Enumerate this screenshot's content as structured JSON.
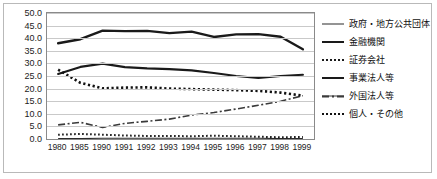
{
  "chart_data": {
    "type": "line",
    "title": "",
    "xlabel": "",
    "ylabel": "",
    "grid": true,
    "legend_position": "right",
    "ylim": [
      0.0,
      50.0
    ],
    "ytick_step": 5.0,
    "yticks": [
      "0.0",
      "5.0",
      "10.0",
      "15.0",
      "20.0",
      "25.0",
      "30.0",
      "35.0",
      "40.0",
      "45.0",
      "50.0"
    ],
    "categories": [
      "1980",
      "1985",
      "1990",
      "1991",
      "1992",
      "1993",
      "1994",
      "1995",
      "1996",
      "1997",
      "1998",
      "1999"
    ],
    "series": [
      {
        "name": "政府・地方公共団体",
        "style": "solid-thin",
        "values": [
          0.2,
          0.2,
          0.3,
          0.3,
          0.3,
          0.3,
          0.3,
          0.3,
          0.3,
          0.3,
          0.2,
          0.2
        ]
      },
      {
        "name": "金融機関",
        "style": "solid-thick",
        "values": [
          25.8,
          28.6,
          29.9,
          28.5,
          28.0,
          27.7,
          27.2,
          26.2,
          25.0,
          24.2,
          25.0,
          25.5
        ]
      },
      {
        "name": "証券会社",
        "style": "dotted",
        "values": [
          1.7,
          2.0,
          1.7,
          1.4,
          1.2,
          1.2,
          1.1,
          1.3,
          1.1,
          0.9,
          0.7,
          0.8
        ]
      },
      {
        "name": "事業法人等",
        "style": "solid-thick-upper",
        "values": [
          38.0,
          39.6,
          43.0,
          42.8,
          42.9,
          42.0,
          42.6,
          40.5,
          41.5,
          41.6,
          40.6,
          35.6
        ]
      },
      {
        "name": "外国法人等",
        "style": "dash-dot",
        "values": [
          5.6,
          6.6,
          4.6,
          6.2,
          7.0,
          7.9,
          9.5,
          10.5,
          11.9,
          13.4,
          15.0,
          17.2
        ]
      },
      {
        "name": "個人・その他",
        "style": "dotted-bold",
        "values": [
          27.5,
          22.3,
          20.1,
          20.4,
          20.5,
          20.0,
          19.8,
          19.6,
          19.4,
          19.1,
          18.4,
          17.2
        ]
      }
    ]
  },
  "legend": {
    "items": [
      {
        "label": "政府・地方公共団体"
      },
      {
        "label": "金融機関"
      },
      {
        "label": "証券会社"
      },
      {
        "label": "事業法人等"
      },
      {
        "label": "外国法人等"
      },
      {
        "label": "個人・その他"
      }
    ]
  }
}
